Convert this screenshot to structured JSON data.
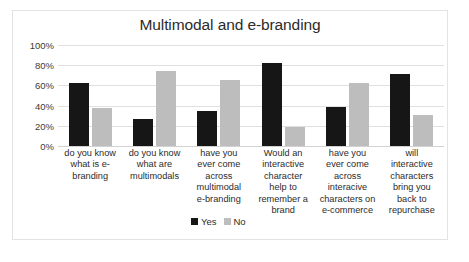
{
  "chart_data": {
    "type": "bar",
    "title": "Multimodal and e-branding",
    "xlabel": "",
    "ylabel": "",
    "ylim": [
      0,
      100
    ],
    "ytick_labels": [
      "100%",
      "80%",
      "60%",
      "40%",
      "20%",
      "0%"
    ],
    "ytick_values": [
      100,
      80,
      60,
      40,
      20,
      0
    ],
    "grid": true,
    "legend_position": "bottom",
    "categories": [
      "do you know what is e-branding",
      "do you know what are multimodals",
      "have you ever come across multimodal e-branding",
      "Would an interactive character help to remember a brand",
      "have you ever come across interacive characters on e-commerce",
      "will interactive characters bring you back to repurchase"
    ],
    "category_lines": [
      [
        "do you know",
        "what is e-",
        "branding"
      ],
      [
        "do you know",
        "what are",
        "multimodals"
      ],
      [
        "have you",
        "ever come",
        "across",
        "multimodal",
        "e-branding"
      ],
      [
        "Would an",
        "interactive",
        "character",
        "help to",
        "remember a",
        "brand"
      ],
      [
        "have you",
        "ever come",
        "across",
        "interacive",
        "characters on",
        "e-commerce"
      ],
      [
        "will",
        "interactive",
        "characters",
        "bring you",
        "back to",
        "repurchase"
      ]
    ],
    "series": [
      {
        "name": "Yes",
        "color": "#161616",
        "values": [
          62,
          27,
          35,
          82,
          39,
          71
        ]
      },
      {
        "name": "No",
        "color": "#bdbdbd",
        "values": [
          38,
          74,
          65,
          19,
          62,
          31
        ]
      }
    ]
  },
  "legend": {
    "items": [
      {
        "label": "Yes",
        "color": "#161616"
      },
      {
        "label": "No",
        "color": "#bdbdbd"
      }
    ]
  }
}
